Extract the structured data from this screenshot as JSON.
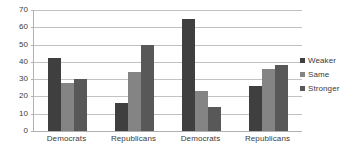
{
  "chart_data": {
    "type": "bar",
    "title": "",
    "subtitle": "",
    "xlabel": "",
    "ylabel": "",
    "categories": [
      "Democrats",
      "Republicans",
      "Democrats",
      "Republicans"
    ],
    "series": [
      {
        "name": "Weaker",
        "color": "#3f3f3f",
        "values": [
          42,
          16,
          65,
          26
        ]
      },
      {
        "name": "Same",
        "color": "#848484",
        "values": [
          28,
          34,
          23,
          36
        ]
      },
      {
        "name": "Stronger",
        "color": "#585858",
        "values": [
          30,
          50,
          14,
          38
        ]
      }
    ],
    "ylim": [
      0,
      70
    ],
    "yticks": [
      0,
      10,
      20,
      30,
      40,
      50,
      60,
      70
    ],
    "ytick_labels": [
      "0",
      "10",
      "20",
      "30",
      "40",
      "50",
      "60",
      "70"
    ],
    "grid": true,
    "grid_axis": "y",
    "legend_position": "right",
    "plot_background": "#ffffff",
    "gridline_color": "#c2c2c2",
    "axis_color": "#b0b0b0",
    "text_color": "#3a3a3a"
  }
}
